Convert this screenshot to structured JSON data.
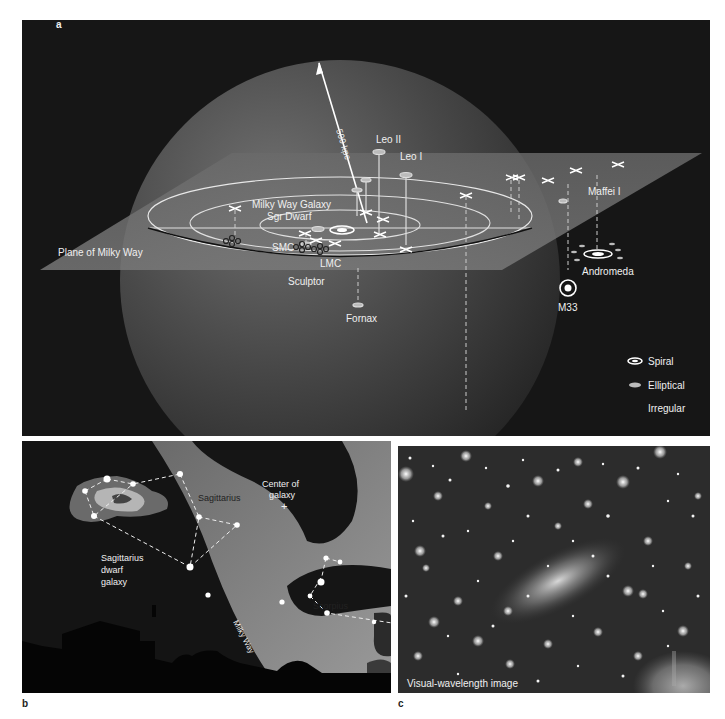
{
  "figure": {
    "panel_a": {
      "letter": "a",
      "scale_label": "500 kpc",
      "plane_label": "Plane of Milky Way",
      "galaxies": {
        "milky_way": "Milky Way Galaxy",
        "sgr_dwarf": "Sgr Dwarf",
        "smc": "SMC",
        "lmc": "LMC",
        "sculptor": "Sculptor",
        "fornax": "Fornax",
        "leo_i": "Leo I",
        "leo_ii": "Leo II",
        "maffei_i": "Maffei I",
        "andromeda": "Andromeda",
        "m33": "M33"
      },
      "legend": {
        "spiral": "Spiral",
        "elliptical": "Elliptical",
        "irregular": "Irregular"
      }
    },
    "panel_b": {
      "letter": "b",
      "labels": {
        "sagittarius": "Sagittarius",
        "center_line1": "Center of",
        "center_line2": "galaxy",
        "center_marker": "+",
        "dwarf_line1": "Sagittarius",
        "dwarf_line2": "dwarf",
        "dwarf_line3": "galaxy",
        "milky_way": "Milky Way",
        "scorpius": "Scorpius"
      }
    },
    "panel_c": {
      "letter": "c",
      "caption": "Visual-wavelength image"
    }
  },
  "colors": {
    "background_dark": "#161616",
    "sphere": "#4a4a4a",
    "plane": "#6e6e6e",
    "milky_way_band": "#7a7a7a",
    "label_white": "#f0f0f0",
    "label_dark": "#222222"
  }
}
